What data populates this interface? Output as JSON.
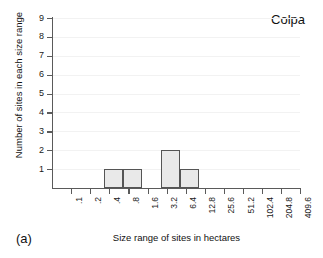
{
  "figure": {
    "panel_label": "(a)",
    "series_title": "Colpa"
  },
  "chart_data": {
    "type": "bar",
    "title": "Colpa",
    "subtitle": "",
    "xlabel": "Size range of sites in hectares",
    "ylabel": "Number of sites in each size range",
    "categories": [
      ".1",
      ".2",
      ".4",
      ".8",
      "1.6",
      "3.2",
      "6.4",
      "12.8",
      "25.6",
      "51.2",
      "102.4",
      "204.8",
      "409.6"
    ],
    "values": [
      1,
      1,
      0,
      2,
      1,
      0,
      0,
      0,
      0,
      0,
      0,
      0,
      0
    ],
    "bars": [
      {
        "bin_index": 0,
        "tick_label": ".1",
        "value": 1
      },
      {
        "bin_index": 1,
        "tick_label": ".2",
        "value": 1
      },
      {
        "bin_index": 2,
        "tick_label": ".4",
        "value": 0
      },
      {
        "bin_index": 3,
        "tick_label": ".8",
        "value": 2
      },
      {
        "bin_index": 4,
        "tick_label": "1.6",
        "value": 1
      },
      {
        "bin_index": 5,
        "tick_label": "3.2",
        "value": 0
      },
      {
        "bin_index": 6,
        "tick_label": "6.4",
        "value": 0
      },
      {
        "bin_index": 7,
        "tick_label": "12.8",
        "value": 0
      },
      {
        "bin_index": 8,
        "tick_label": "25.6",
        "value": 0
      },
      {
        "bin_index": 9,
        "tick_label": "51.2",
        "value": 0
      },
      {
        "bin_index": 10,
        "tick_label": "102.4",
        "value": 0
      },
      {
        "bin_index": 11,
        "tick_label": "204.8",
        "value": 0
      },
      {
        "bin_index": 12,
        "tick_label": "409.6",
        "value": 0
      }
    ],
    "yticks": [
      1,
      2,
      3,
      4,
      5,
      6,
      7,
      8,
      9
    ],
    "ytick_labels": [
      "1",
      "2",
      "3",
      "4",
      "5",
      "6",
      "7",
      "8",
      "9"
    ],
    "xtick_labels": [
      ".1",
      ".2",
      ".4",
      ".8",
      "1.6",
      "3.2",
      "6.4",
      "12.8",
      "25.6",
      "51.2",
      "102.4",
      "204.8",
      "409.6"
    ],
    "ylim": [
      0,
      9
    ],
    "grid": true,
    "grid_axis": "y",
    "legend": false,
    "xtick_label_rotation": 90,
    "colors": {
      "bar_fill": "#e9e9e9",
      "bar_edge": "#555555",
      "axis": "#5a5a5a",
      "grid": "#f2f2f2",
      "text": "#111111",
      "background": "#ffffff"
    }
  }
}
